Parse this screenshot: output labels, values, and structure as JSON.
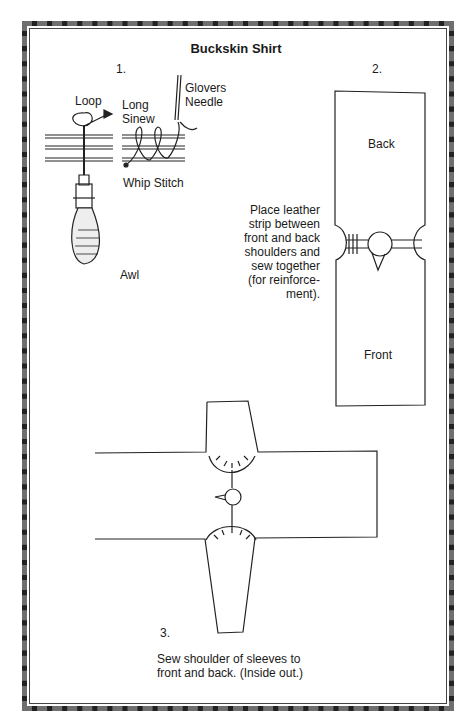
{
  "title": "Buckskin Shirt",
  "step1": {
    "number": "1.",
    "labels": {
      "loop": "Loop",
      "long_sinew": "Long\nSinew",
      "glovers_needle": "Glovers\nNeedle",
      "whip_stitch": "Whip Stitch",
      "awl": "Awl"
    }
  },
  "step2": {
    "number": "2.",
    "labels": {
      "back": "Back",
      "front": "Front"
    },
    "caption": [
      "Place leather",
      "strip between",
      "front and back",
      "shoulders and",
      "sew together",
      "(for reinforce-",
      "ment)."
    ]
  },
  "step3": {
    "number": "3.",
    "caption": [
      "Sew shoulder of sleeves to",
      "front and back. (Inside out.)"
    ]
  }
}
